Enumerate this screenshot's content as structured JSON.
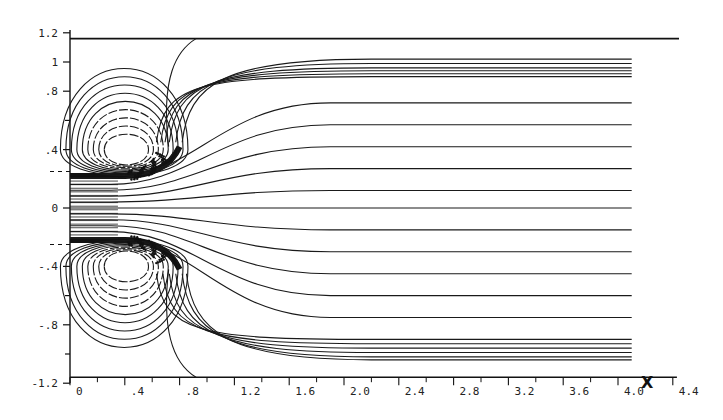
{
  "chart_data": {
    "type": "line",
    "subtype": "streamline-contour",
    "title": "",
    "xlabel": "X",
    "ylabel": "",
    "xlim": [
      0,
      4.4
    ],
    "ylim": [
      -1.2,
      1.2
    ],
    "grid": false,
    "legend": null,
    "x_ticks": [
      "0",
      ".4",
      ".8",
      "1.2",
      "1.6",
      "2.0",
      "2.4",
      "2.8",
      "3.2",
      "3.6",
      "4.0",
      "4.4"
    ],
    "x_tick_values": [
      0,
      0.4,
      0.8,
      1.2,
      1.6,
      2.0,
      2.4,
      2.8,
      3.2,
      3.6,
      4.0,
      4.4
    ],
    "y_ticks": [
      "1.2",
      "1",
      ".8",
      ".4",
      "0",
      "-.4",
      "-.8",
      "-1.2"
    ],
    "y_tick_values": [
      1.2,
      1.0,
      0.8,
      0.4,
      0,
      -0.4,
      -0.8,
      -1.2
    ],
    "y_minor_ticks": [
      0.6,
      -0.6,
      -1.0
    ],
    "inlet_half_width": 0.22,
    "inlet_dash_markers_y": [
      0.25,
      -0.25
    ],
    "channel_wall_y": [
      1.12,
      -1.2
    ],
    "vortices": [
      {
        "name": "upper-recirculation-bubble",
        "center": [
          0.42,
          0.4
        ],
        "core_radius": [
          0.17,
          0.14
        ],
        "reattachment_x": 0.92
      },
      {
        "name": "lower-recirculation-bubble",
        "center": [
          0.42,
          -0.4
        ],
        "core_radius": [
          0.17,
          0.14
        ],
        "reattachment_x": 0.92
      }
    ],
    "vortex_contour_levels": 9,
    "outlet_streamline_y": [
      1.02,
      0.99,
      0.96,
      0.94,
      0.92,
      0.9,
      0.72,
      0.57,
      0.42,
      0.27,
      0.12,
      0.0,
      -0.15,
      -0.3,
      -0.45,
      -0.6,
      -0.75,
      -0.9,
      -0.93,
      -0.96,
      -0.99,
      -1.02,
      -1.04
    ],
    "inlet_streamline_count": 18,
    "streamlines_end_x": 4.1,
    "annotations": [
      "X"
    ]
  },
  "axes": {
    "x_label": "X",
    "y_labels": [
      "1.2",
      "1",
      ".8",
      ".4",
      "0",
      "-.4",
      "-.8",
      "-1.2"
    ],
    "x_labels": [
      "0",
      ".4",
      ".8",
      "1.2",
      "1.6",
      "2.0",
      "2.4",
      "2.8",
      "3.2",
      "3.6",
      "4.0",
      "4.4"
    ]
  }
}
